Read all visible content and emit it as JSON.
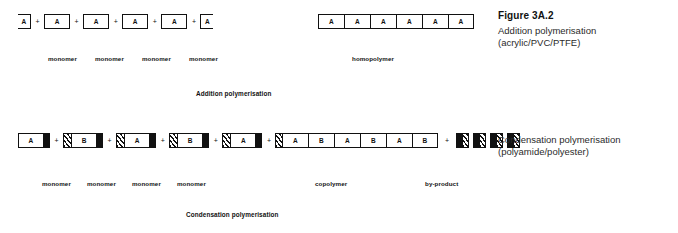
{
  "figure": {
    "number": "Figure 3A.2",
    "addition_caption_line1": "Addition polymerisation",
    "addition_caption_line2": "(acrylic/PVC/PTFE)",
    "condensation_caption_line1": "Condensation polymerisation",
    "condensation_caption_line2": "(polyamide/polyester)"
  },
  "colors": {
    "ink": "#111111",
    "paper": "#ffffff",
    "caption_text": "#2b2b2b"
  },
  "symbols": {
    "plus": "+"
  },
  "addition": {
    "process_label": "Addition polymerisation",
    "reactants": {
      "units": [
        {
          "letter": "A",
          "shape": "clip-left"
        },
        {
          "letter": "A",
          "shape": "full"
        },
        {
          "letter": "A",
          "shape": "full"
        },
        {
          "letter": "A",
          "shape": "full"
        },
        {
          "letter": "A",
          "shape": "full"
        },
        {
          "letter": "A",
          "shape": "clip-right"
        }
      ],
      "labels": [
        "monomer",
        "monomer",
        "monomer",
        "monomer"
      ]
    },
    "product": {
      "name": "homopolymer",
      "chain": [
        "A",
        "A",
        "A",
        "A",
        "A",
        "A"
      ]
    }
  },
  "condensation": {
    "process_label": "Condensation polymerisation",
    "reactants": {
      "units": [
        {
          "letter": "A",
          "left_group": "none",
          "right_group": "black"
        },
        {
          "letter": "B",
          "left_group": "hatched",
          "right_group": "black"
        },
        {
          "letter": "A",
          "left_group": "hatched",
          "right_group": "black"
        },
        {
          "letter": "B",
          "left_group": "hatched",
          "right_group": "black"
        },
        {
          "letter": "A",
          "left_group": "hatched",
          "right_group": "black"
        },
        {
          "letter": "B",
          "left_group": "hatched",
          "right_group": "none"
        }
      ],
      "labels": [
        "monomer",
        "monomer",
        "monomer",
        "monomer"
      ]
    },
    "product": {
      "name": "copolymer",
      "chain": [
        "A",
        "B",
        "A",
        "B",
        "A",
        "B"
      ]
    },
    "byproduct": {
      "name": "by-product",
      "count": 4
    }
  }
}
